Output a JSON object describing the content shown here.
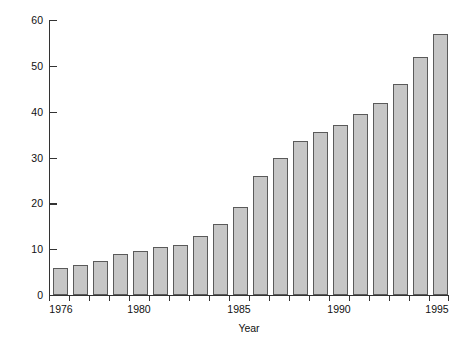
{
  "chart_data": {
    "type": "bar",
    "title": "",
    "xlabel": "Year",
    "ylabel": "Number of Persons (in millions)",
    "categories": [
      "1976",
      "1977",
      "1978",
      "1979",
      "1980",
      "1981",
      "1982",
      "1983",
      "1984",
      "1985",
      "1986",
      "1987",
      "1988",
      "1989",
      "1990",
      "1991",
      "1992",
      "1993",
      "1994",
      "1995"
    ],
    "values": [
      6,
      6.5,
      7.5,
      9,
      9.5,
      10.5,
      11,
      12.8,
      15.5,
      19.3,
      26,
      30,
      33.5,
      35.5,
      37,
      39.5,
      42,
      46,
      52,
      57
    ],
    "ylim": [
      0,
      60
    ],
    "yticks": [
      0,
      10,
      20,
      30,
      40,
      50,
      60
    ],
    "ytick_labels": [
      "0",
      "10",
      "20",
      "30",
      "40",
      "50",
      "60"
    ],
    "xtick_labels": [
      "1976",
      "1980",
      "1985",
      "1990",
      "1995"
    ],
    "xtick_categories": [
      "1976",
      "1980",
      "1985",
      "1990",
      "1995"
    ],
    "grid": false,
    "legend": null,
    "bar_fill_color": "#c6c6c6",
    "bar_edge_color": "#5a5a5a",
    "axis_color": "#333333",
    "background_color": "#ffffff"
  }
}
